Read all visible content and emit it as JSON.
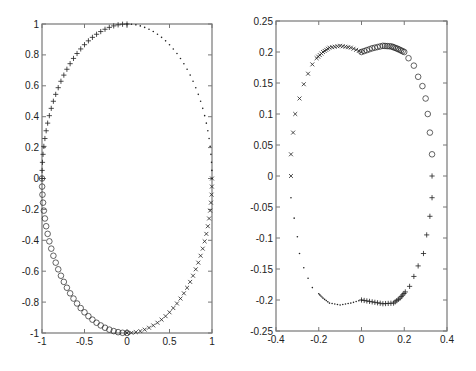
{
  "chart_data": [
    {
      "type": "scatter",
      "title": "",
      "xlabel": "",
      "ylabel": "",
      "xlim": [
        -1,
        1
      ],
      "ylim": [
        -1,
        1
      ],
      "grid": false,
      "legend": "none",
      "x_ticks": [
        "-1",
        "-0.5",
        "0",
        "0.5",
        "1"
      ],
      "x_tick_values": [
        -1,
        -0.5,
        0,
        0.5,
        1
      ],
      "y_ticks": [
        "-1",
        "-0.8",
        "-0.6",
        "-0.4",
        "-0.2",
        "0",
        "0.2",
        "0.4",
        "0.6",
        "0.8",
        "1"
      ],
      "y_tick_values": [
        -1,
        -0.8,
        -0.6,
        -0.4,
        -0.2,
        0,
        0.2,
        0.4,
        0.6,
        0.8,
        1
      ],
      "description": "Unit circle sampled in four quadrants with different markers",
      "series": [
        {
          "name": "quadrant-upper-right",
          "marker": ".",
          "angle_range_deg": [
            0,
            90
          ]
        },
        {
          "name": "quadrant-upper-left",
          "marker": "+",
          "angle_range_deg": [
            90,
            180
          ]
        },
        {
          "name": "quadrant-lower-left",
          "marker": "o",
          "angle_range_deg": [
            180,
            270
          ]
        },
        {
          "name": "quadrant-lower-right",
          "marker": "x",
          "angle_range_deg": [
            270,
            360
          ]
        }
      ],
      "points_per_series": 30
    },
    {
      "type": "scatter",
      "title": "",
      "xlabel": "",
      "ylabel": "",
      "xlim": [
        -0.4,
        0.4
      ],
      "ylim": [
        -0.25,
        0.25
      ],
      "grid": false,
      "legend": "none",
      "x_ticks": [
        "-0.4",
        "-0.2",
        "0",
        "0.2",
        "0.4"
      ],
      "x_tick_values": [
        -0.4,
        -0.2,
        0,
        0.2,
        0.4
      ],
      "y_ticks": [
        "-0.25",
        "-0.2",
        "-0.15",
        "-0.1",
        "-0.05",
        "0",
        "0.05",
        "0.1",
        "0.15",
        "0.2",
        "0.25"
      ],
      "y_tick_values": [
        -0.25,
        -0.2,
        -0.15,
        -0.1,
        -0.05,
        0,
        0.05,
        0.1,
        0.15,
        0.2,
        0.25
      ],
      "description": "Image of the circle under a nonlinear map; peanut-shaped closed curve",
      "series": [
        {
          "name": "upper-left-arc",
          "marker": "x",
          "approx_points": [
            [
              -0.33,
              0.0
            ],
            [
              -0.33,
              0.035
            ],
            [
              -0.32,
              0.07
            ],
            [
              -0.31,
              0.1
            ],
            [
              -0.29,
              0.125
            ],
            [
              -0.27,
              0.148
            ],
            [
              -0.25,
              0.165
            ],
            [
              -0.23,
              0.18
            ],
            [
              -0.21,
              0.19
            ],
            [
              -0.18,
              0.2
            ],
            [
              -0.15,
              0.207
            ],
            [
              -0.1,
              0.21
            ],
            [
              -0.05,
              0.207
            ],
            [
              0.0,
              0.2
            ]
          ]
        },
        {
          "name": "upper-right-arc",
          "marker": "o",
          "approx_points": [
            [
              0.0,
              0.2
            ],
            [
              0.05,
              0.206
            ],
            [
              0.1,
              0.21
            ],
            [
              0.14,
              0.209
            ],
            [
              0.17,
              0.205
            ],
            [
              0.2,
              0.2
            ],
            [
              0.22,
              0.19
            ],
            [
              0.245,
              0.178
            ],
            [
              0.265,
              0.16
            ],
            [
              0.285,
              0.145
            ],
            [
              0.3,
              0.125
            ],
            [
              0.31,
              0.1
            ],
            [
              0.32,
              0.07
            ],
            [
              0.33,
              0.035
            ]
          ]
        },
        {
          "name": "lower-right-arc",
          "marker": "+",
          "approx_points": [
            [
              0.33,
              0.0
            ],
            [
              0.33,
              -0.035
            ],
            [
              0.32,
              -0.065
            ],
            [
              0.305,
              -0.095
            ],
            [
              0.29,
              -0.125
            ],
            [
              0.265,
              -0.145
            ],
            [
              0.245,
              -0.162
            ],
            [
              0.225,
              -0.178
            ],
            [
              0.205,
              -0.187
            ],
            [
              0.18,
              -0.197
            ],
            [
              0.15,
              -0.205
            ],
            [
              0.1,
              -0.206
            ],
            [
              0.05,
              -0.203
            ],
            [
              0.0,
              -0.2
            ]
          ]
        },
        {
          "name": "lower-left-arc",
          "marker": ".",
          "approx_points": [
            [
              0.0,
              -0.2
            ],
            [
              -0.05,
              -0.205
            ],
            [
              -0.1,
              -0.208
            ],
            [
              -0.15,
              -0.205
            ],
            [
              -0.18,
              -0.197
            ],
            [
              -0.2,
              -0.19
            ],
            [
              -0.23,
              -0.18
            ],
            [
              -0.25,
              -0.165
            ],
            [
              -0.27,
              -0.148
            ],
            [
              -0.29,
              -0.125
            ],
            [
              -0.3,
              -0.098
            ],
            [
              -0.315,
              -0.068
            ],
            [
              -0.33,
              -0.035
            ]
          ]
        }
      ]
    }
  ],
  "layout": {
    "left_axes": {
      "x0": 42,
      "y0": 24,
      "x1": 212,
      "y1": 333
    },
    "right_axes": {
      "x0": 276,
      "y0": 21,
      "x1": 447,
      "y1": 331
    },
    "axis_color": "#777777",
    "marker_color": "#222222"
  }
}
